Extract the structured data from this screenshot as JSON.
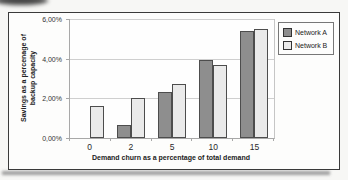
{
  "chart_data": {
    "type": "bar",
    "title": "",
    "xlabel": "Demand churn as a percentage of total demand",
    "ylabel": "Savings as a percenage of backup capacity",
    "ylabel_lines": [
      "Savings as a percenage of",
      "backup capacity"
    ],
    "categories": [
      "0",
      "2",
      "5",
      "10",
      "15"
    ],
    "series": [
      {
        "name": "Network A",
        "color": "#8e8e8e",
        "values": [
          0,
          0.65,
          2.3,
          3.95,
          5.4
        ]
      },
      {
        "name": "Network B",
        "color": "#eaeaea",
        "values": [
          1.6,
          2.0,
          2.7,
          3.7,
          5.5
        ]
      }
    ],
    "ylim": [
      0,
      6
    ],
    "ytick_values": [
      0,
      2,
      4,
      6
    ],
    "ytick_labels": [
      "0,00%",
      "2,00%",
      "4,00%",
      "6,00%"
    ],
    "grid": true,
    "legend_position": "top-right",
    "bar_border_color": "#4d4d4d"
  }
}
